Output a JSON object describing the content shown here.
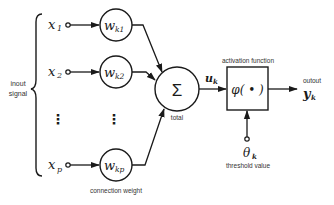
{
  "diagram": {
    "inputs": [
      {
        "symbol": "x",
        "sub": "1",
        "weight_symbol": "w",
        "weight_sub": "k1"
      },
      {
        "symbol": "x",
        "sub": "2",
        "weight_symbol": "w",
        "weight_sub": "k2"
      },
      {
        "symbol": "x",
        "sub": "p",
        "weight_symbol": "w",
        "weight_sub": "kp"
      }
    ],
    "ellipsis": "⋮",
    "input_label_line1": "inout",
    "input_label_line2": "signal",
    "weights_label": "connection weight",
    "sum_symbol": "Σ",
    "sum_label": "total",
    "sum_output_symbol": "u",
    "sum_output_sub": "k",
    "activation_label": "activation function",
    "activation_symbol": "φ( • )",
    "output_label": "outout",
    "output_symbol": "y",
    "output_sub": "k",
    "threshold_symbol": "θ",
    "threshold_sub": "k",
    "threshold_label": "threshold value"
  },
  "colors": {
    "stroke": "#1a1a1a",
    "label": "#333333",
    "background": "#ffffff"
  }
}
